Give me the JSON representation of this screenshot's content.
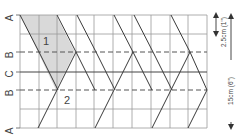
{
  "row_labels": [
    {
      "id": "A-top",
      "text": "A"
    },
    {
      "id": "B-upper",
      "text": "B"
    },
    {
      "id": "C",
      "text": "C"
    },
    {
      "id": "B-lower",
      "text": "B"
    },
    {
      "id": "A-bottom",
      "text": "A"
    }
  ],
  "region_labels": {
    "upper": "1",
    "lower": "2"
  },
  "dimensions": {
    "small": "2.5cm (1\")",
    "large": "15cm (6\")"
  },
  "colors": {
    "line": "#3a3a3a",
    "grid": "#9a9a9a",
    "shade": "#d9d9d9",
    "text": "#444444"
  }
}
